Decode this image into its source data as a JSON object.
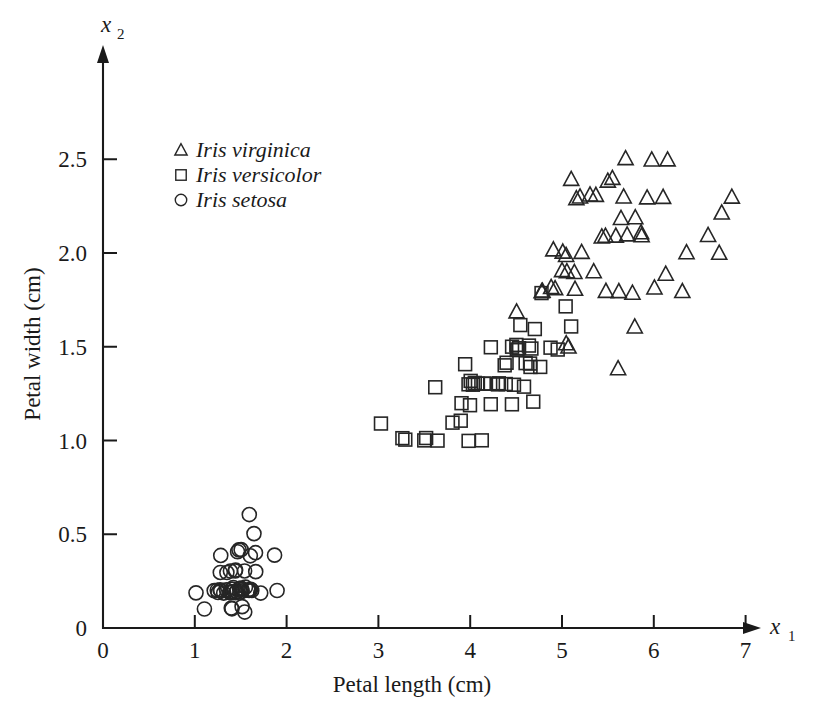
{
  "chart_data": {
    "type": "scatter",
    "title": "",
    "xlabel": "Petal length (cm)",
    "ylabel": "Petal width (cm)",
    "x_axis_variable": "x",
    "x_axis_subscript": "1",
    "y_axis_variable": "x",
    "y_axis_subscript": "2",
    "xlim": [
      0,
      7.35
    ],
    "ylim": [
      0,
      2.78
    ],
    "xticks": [
      0,
      1,
      2,
      3,
      4,
      5,
      6,
      7
    ],
    "xticklabels": [
      "0",
      "1",
      "2",
      "3",
      "4",
      "5",
      "6",
      "7"
    ],
    "yticks": [
      0,
      0.5,
      1.0,
      1.5,
      2.0,
      2.5
    ],
    "yticklabels": [
      "0",
      "0.5",
      "1.0",
      "1.5",
      "2.0",
      "2.5"
    ],
    "grid": false,
    "legend_position": "upper left",
    "axis_style": "arrow-terminated L-frame",
    "marker_color": "#262626",
    "background_color": "#ffffff",
    "series": [
      {
        "name": "Iris virginica",
        "marker": "triangle",
        "points": [
          [
            6.0,
            2.5
          ],
          [
            5.1,
            1.9
          ],
          [
            5.9,
            2.1
          ],
          [
            5.6,
            1.8
          ],
          [
            5.8,
            2.2
          ],
          [
            6.6,
            2.1
          ],
          [
            4.5,
            1.7
          ],
          [
            6.3,
            1.8
          ],
          [
            5.8,
            1.8
          ],
          [
            6.1,
            2.5
          ],
          [
            5.1,
            2.0
          ],
          [
            5.3,
            1.9
          ],
          [
            5.5,
            2.1
          ],
          [
            5.0,
            2.0
          ],
          [
            5.1,
            2.4
          ],
          [
            5.3,
            2.3
          ],
          [
            5.5,
            1.8
          ],
          [
            6.7,
            2.2
          ],
          [
            6.9,
            2.3
          ],
          [
            5.0,
            1.5
          ],
          [
            5.7,
            2.3
          ],
          [
            4.9,
            2.0
          ],
          [
            6.7,
            2.0
          ],
          [
            4.9,
            1.8
          ],
          [
            5.7,
            2.1
          ],
          [
            6.0,
            1.8
          ],
          [
            4.8,
            1.8
          ],
          [
            4.9,
            1.8
          ],
          [
            5.6,
            2.1
          ],
          [
            5.8,
            1.6
          ],
          [
            6.1,
            1.9
          ],
          [
            6.4,
            2.0
          ],
          [
            5.6,
            2.2
          ],
          [
            5.1,
            1.5
          ],
          [
            5.6,
            1.4
          ],
          [
            6.1,
            2.3
          ],
          [
            5.5,
            2.4
          ],
          [
            4.8,
            1.8
          ],
          [
            5.4,
            2.1
          ],
          [
            5.6,
            2.4
          ],
          [
            5.1,
            2.3
          ],
          [
            5.1,
            1.9
          ],
          [
            5.9,
            2.3
          ],
          [
            5.7,
            2.5
          ],
          [
            5.2,
            2.3
          ],
          [
            5.0,
            1.9
          ],
          [
            5.2,
            2.0
          ],
          [
            5.4,
            2.3
          ],
          [
            5.1,
            1.8
          ],
          [
            5.9,
            2.1
          ]
        ]
      },
      {
        "name": "Iris versicolor",
        "marker": "square",
        "points": [
          [
            4.7,
            1.4
          ],
          [
            4.5,
            1.5
          ],
          [
            4.9,
            1.5
          ],
          [
            4.0,
            1.3
          ],
          [
            4.6,
            1.5
          ],
          [
            4.5,
            1.3
          ],
          [
            4.7,
            1.6
          ],
          [
            3.3,
            1.0
          ],
          [
            4.6,
            1.3
          ],
          [
            3.9,
            1.4
          ],
          [
            3.5,
            1.0
          ],
          [
            4.2,
            1.5
          ],
          [
            4.0,
            1.0
          ],
          [
            4.7,
            1.4
          ],
          [
            3.6,
            1.3
          ],
          [
            4.4,
            1.4
          ],
          [
            4.5,
            1.5
          ],
          [
            4.1,
            1.0
          ],
          [
            4.5,
            1.5
          ],
          [
            3.9,
            1.1
          ],
          [
            4.8,
            1.8
          ],
          [
            4.0,
            1.3
          ],
          [
            4.9,
            1.5
          ],
          [
            4.7,
            1.2
          ],
          [
            4.3,
            1.3
          ],
          [
            4.4,
            1.4
          ],
          [
            4.8,
            1.4
          ],
          [
            5.0,
            1.7
          ],
          [
            4.5,
            1.5
          ],
          [
            3.5,
            1.0
          ],
          [
            3.8,
            1.1
          ],
          [
            3.7,
            1.0
          ],
          [
            3.9,
            1.2
          ],
          [
            5.1,
            1.6
          ],
          [
            4.5,
            1.5
          ],
          [
            4.5,
            1.6
          ],
          [
            4.7,
            1.5
          ],
          [
            4.4,
            1.3
          ],
          [
            4.1,
            1.3
          ],
          [
            4.0,
            1.3
          ],
          [
            4.4,
            1.2
          ],
          [
            4.6,
            1.4
          ],
          [
            4.0,
            1.2
          ],
          [
            3.3,
            1.0
          ],
          [
            4.2,
            1.3
          ],
          [
            4.2,
            1.2
          ],
          [
            4.2,
            1.3
          ],
          [
            4.3,
            1.3
          ],
          [
            3.0,
            1.1
          ],
          [
            4.1,
            1.3
          ]
        ]
      },
      {
        "name": "Iris setosa",
        "marker": "circle",
        "points": [
          [
            1.4,
            0.2
          ],
          [
            1.4,
            0.2
          ],
          [
            1.3,
            0.2
          ],
          [
            1.5,
            0.2
          ],
          [
            1.4,
            0.2
          ],
          [
            1.7,
            0.4
          ],
          [
            1.4,
            0.3
          ],
          [
            1.5,
            0.2
          ],
          [
            1.4,
            0.2
          ],
          [
            1.5,
            0.1
          ],
          [
            1.5,
            0.2
          ],
          [
            1.6,
            0.2
          ],
          [
            1.4,
            0.1
          ],
          [
            1.1,
            0.1
          ],
          [
            1.2,
            0.2
          ],
          [
            1.5,
            0.4
          ],
          [
            1.3,
            0.4
          ],
          [
            1.4,
            0.3
          ],
          [
            1.7,
            0.3
          ],
          [
            1.5,
            0.3
          ],
          [
            1.7,
            0.2
          ],
          [
            1.5,
            0.4
          ],
          [
            1.0,
            0.2
          ],
          [
            1.7,
            0.5
          ],
          [
            1.9,
            0.2
          ],
          [
            1.6,
            0.2
          ],
          [
            1.6,
            0.4
          ],
          [
            1.5,
            0.2
          ],
          [
            1.4,
            0.2
          ],
          [
            1.6,
            0.2
          ],
          [
            1.6,
            0.2
          ],
          [
            1.5,
            0.4
          ],
          [
            1.5,
            0.1
          ],
          [
            1.4,
            0.2
          ],
          [
            1.5,
            0.2
          ],
          [
            1.2,
            0.2
          ],
          [
            1.3,
            0.2
          ],
          [
            1.4,
            0.1
          ],
          [
            1.3,
            0.2
          ],
          [
            1.5,
            0.2
          ],
          [
            1.3,
            0.3
          ],
          [
            1.3,
            0.3
          ],
          [
            1.3,
            0.2
          ],
          [
            1.6,
            0.6
          ],
          [
            1.9,
            0.4
          ],
          [
            1.4,
            0.3
          ],
          [
            1.6,
            0.2
          ],
          [
            1.4,
            0.2
          ],
          [
            1.5,
            0.2
          ],
          [
            1.4,
            0.2
          ]
        ]
      }
    ],
    "legend": [
      {
        "label": "Iris virginica",
        "marker": "triangle"
      },
      {
        "label": "Iris versicolor",
        "marker": "square"
      },
      {
        "label": "Iris setosa",
        "marker": "circle"
      }
    ]
  }
}
